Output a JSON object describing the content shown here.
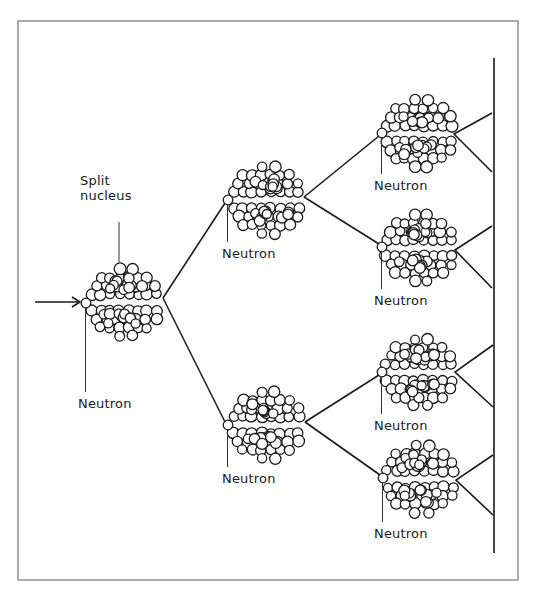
{
  "diagram": {
    "colors": {
      "ink": "#1a1a1a",
      "frame": "#8a8a8a",
      "background": "#ffffff"
    },
    "labels": {
      "split_nucleus": [
        "Split",
        "nucleus"
      ],
      "neutron": "Neutron"
    },
    "incoming_arrow": {
      "x1": 35,
      "y1": 302,
      "x2": 80,
      "y2": 302
    },
    "frame": {
      "x": 18,
      "y": 21,
      "width": 500,
      "height": 559
    },
    "boundary_line": {
      "x": 494,
      "y1": 58,
      "y2": 553
    },
    "generations": [
      {
        "level": 1,
        "nuclei": [
          {
            "id": "n1",
            "neutron": [
              86,
              303
            ],
            "cx": 124,
            "top_y": 285,
            "bottom_y": 320,
            "label": [
              78,
              408
            ]
          }
        ]
      },
      {
        "level": 2,
        "nuclei": [
          {
            "id": "n2a",
            "neutron": [
              228,
              200
            ],
            "cx": 266,
            "top_y": 182,
            "bottom_y": 218,
            "label": [
              222,
              258
            ]
          },
          {
            "id": "n2b",
            "neutron": [
              228,
              425
            ],
            "cx": 266,
            "top_y": 407,
            "bottom_y": 443,
            "label": [
              222,
              483
            ]
          }
        ]
      },
      {
        "level": 3,
        "nuclei": [
          {
            "id": "n3a",
            "neutron": [
              382,
              133
            ],
            "cx": 419,
            "top_y": 116,
            "bottom_y": 151,
            "label": [
              374,
              190
            ]
          },
          {
            "id": "n3b",
            "neutron": [
              382,
              247
            ],
            "cx": 419,
            "top_y": 230,
            "bottom_y": 266,
            "label": [
              374,
              305
            ]
          },
          {
            "id": "n3c",
            "neutron": [
              382,
              372
            ],
            "cx": 419,
            "top_y": 355,
            "bottom_y": 390,
            "label": [
              374,
              430
            ]
          },
          {
            "id": "n3d",
            "neutron": [
              383,
              478
            ],
            "cx": 420,
            "top_y": 461,
            "bottom_y": 497,
            "label": [
              374,
              538
            ]
          }
        ]
      }
    ],
    "split_nucleus_label_pos": [
      80,
      185
    ],
    "split_nucleus_pointer": {
      "x": 119,
      "y1": 222,
      "y2": 262
    },
    "branches": [
      {
        "vertex": [
          163,
          298
        ],
        "to": [
          [
            225,
            203
          ],
          [
            225,
            422
          ]
        ]
      },
      {
        "vertex": [
          304,
          197
        ],
        "to": [
          [
            379,
            136
          ],
          [
            379,
            244
          ]
        ]
      },
      {
        "vertex": [
          305,
          422
        ],
        "to": [
          [
            379,
            375
          ],
          [
            380,
            475
          ]
        ]
      }
    ],
    "end_brackets": [
      {
        "vertex": [
          454,
          134
        ],
        "to": [
          [
            492,
            113
          ],
          [
            492,
            172
          ]
        ]
      },
      {
        "vertex": [
          455,
          250
        ],
        "to": [
          [
            492,
            226
          ],
          [
            492,
            288
          ]
        ]
      },
      {
        "vertex": [
          455,
          372
        ],
        "to": [
          [
            493,
            345
          ],
          [
            493,
            407
          ]
        ]
      },
      {
        "vertex": [
          456,
          480
        ],
        "to": [
          [
            493,
            455
          ],
          [
            493,
            515
          ]
        ]
      }
    ]
  }
}
